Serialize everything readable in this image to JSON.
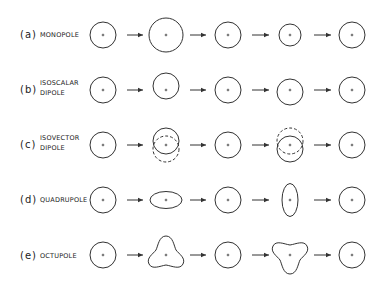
{
  "diagram": {
    "rows": [
      {
        "tag": "(a)",
        "name_line1": "MONOPOLE",
        "name_line2": "",
        "mode": "monopole"
      },
      {
        "tag": "(b)",
        "name_line1": "ISOSCALAR",
        "name_line2": "DIPOLE",
        "mode": "isoscalar-dipole"
      },
      {
        "tag": "(c)",
        "name_line1": "ISOVECTOR",
        "name_line2": "DIPOLE",
        "mode": "isovector-dipole"
      },
      {
        "tag": "(d)",
        "name_line1": "QUADRUPOLE",
        "name_line2": "",
        "mode": "quadrupole"
      },
      {
        "tag": "(e)",
        "name_line1": "OCTUPOLE",
        "name_line2": "",
        "mode": "octupole"
      }
    ],
    "center_marker": "+",
    "stages_per_row": 5,
    "arrow_symbol": "→",
    "colors": {
      "stroke": "#333333",
      "background": "#ffffff"
    }
  }
}
